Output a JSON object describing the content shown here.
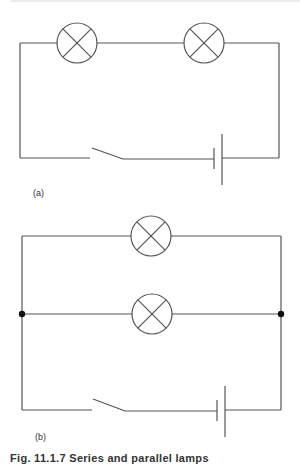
{
  "figure": {
    "panels": [
      {
        "label": "(a)",
        "type": "series",
        "lamps": [
          {
            "cx": 77,
            "cy": 43,
            "r": 20
          },
          {
            "cx": 204,
            "cy": 43,
            "r": 20
          }
        ],
        "frame": {
          "left": 20,
          "right": 279,
          "top": 43,
          "bottom": 158
        },
        "switch": {
          "gap_start": 90,
          "blade_x1": 92,
          "blade_y1": 148,
          "blade_x2": 123,
          "blade_y2": 159
        },
        "battery": {
          "short_plate_x": 214,
          "short_top": 148,
          "short_bottom": 169,
          "long_plate_x": 222,
          "long_top": 134,
          "long_bottom": 185
        }
      },
      {
        "label": "(b)",
        "type": "parallel",
        "lamps": [
          {
            "cx": 151,
            "cy": 236,
            "r": 20
          },
          {
            "cx": 152,
            "cy": 314,
            "r": 20
          }
        ],
        "frame": {
          "left": 22,
          "right": 281,
          "top": 236,
          "middle": 314,
          "bottom": 410
        },
        "junctions": [
          {
            "cx": 22,
            "cy": 314
          },
          {
            "cx": 281,
            "cy": 314
          }
        ],
        "switch": {
          "gap_start": 92,
          "blade_x1": 93,
          "blade_y1": 399,
          "blade_x2": 125,
          "blade_y2": 411
        },
        "battery": {
          "short_plate_x": 217,
          "short_top": 400,
          "short_bottom": 421,
          "long_plate_x": 225,
          "long_top": 386,
          "long_bottom": 437
        }
      }
    ],
    "caption": "Fig. 11.1.7 Series and parallel lamps"
  },
  "colors": {
    "wire": "#555555",
    "junction": "#111111",
    "background": "#ffffff"
  }
}
